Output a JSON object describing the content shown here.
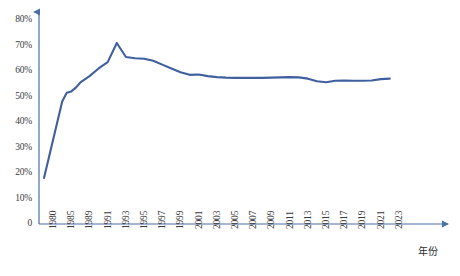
{
  "chart_data": {
    "type": "line",
    "title": "",
    "xlabel": "年份",
    "ylabel": "",
    "ylim": [
      0,
      80
    ],
    "yticks": [
      0,
      10,
      20,
      30,
      40,
      50,
      60,
      70,
      80
    ],
    "ytick_labels": [
      "0",
      "10%",
      "20%",
      "30%",
      "40%",
      "50%",
      "60%",
      "70%",
      "80%"
    ],
    "xtick_labels": [
      "1980",
      "1985",
      "1989",
      "1991",
      "1993",
      "1995",
      "1997",
      "1999",
      "2001",
      "2003",
      "2005",
      "2007",
      "2009",
      "2011",
      "2013",
      "2015",
      "2017",
      "2019",
      "2021",
      "2023"
    ],
    "grid": false,
    "legend": null,
    "line_color": "#3f5f9e",
    "series": [
      {
        "name": "",
        "x": [
          1980,
          1985,
          1986,
          1987,
          1988,
          1989,
          1990,
          1991,
          1992,
          1993,
          1994,
          1995,
          1996,
          1997,
          1998,
          1999,
          2000,
          2001,
          2002,
          2003,
          2004,
          2005,
          2006,
          2007,
          2008,
          2009,
          2010,
          2011,
          2012,
          2013,
          2014,
          2015,
          2016,
          2017,
          2018,
          2019,
          2020,
          2021,
          2022,
          2023
        ],
        "values": [
          18.0,
          48.0,
          51.5,
          52.0,
          53.5,
          55.5,
          58.0,
          61.0,
          63.5,
          71.0,
          65.5,
          65.0,
          64.8,
          64.0,
          62.5,
          61.0,
          59.5,
          58.5,
          58.6,
          58.0,
          57.6,
          57.4,
          57.3,
          57.3,
          57.3,
          57.3,
          57.4,
          57.5,
          57.6,
          57.5,
          57.0,
          56.0,
          55.6,
          56.2,
          56.3,
          56.2,
          56.2,
          56.3,
          56.8,
          57.0
        ]
      }
    ]
  }
}
